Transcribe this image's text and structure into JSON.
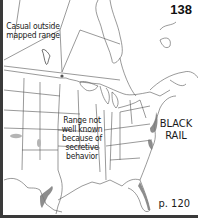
{
  "map": {
    "page_number": "138",
    "species_name_line1": "BLACK",
    "species_name_line2": "RAIL",
    "page_reference": "p. 120",
    "annotations": {
      "casual_line1": "Casual outside",
      "casual_line2": "mapped range",
      "range_line1": "Range not",
      "range_line2": "well known",
      "range_line3": "because of",
      "range_line4": "secretive",
      "range_line5": "behavior"
    },
    "colors": {
      "frame": "#3a3a3a",
      "outline": "#444444",
      "range_fill": "#8a8a8a",
      "isolated_range": "#b5b5b5"
    }
  }
}
